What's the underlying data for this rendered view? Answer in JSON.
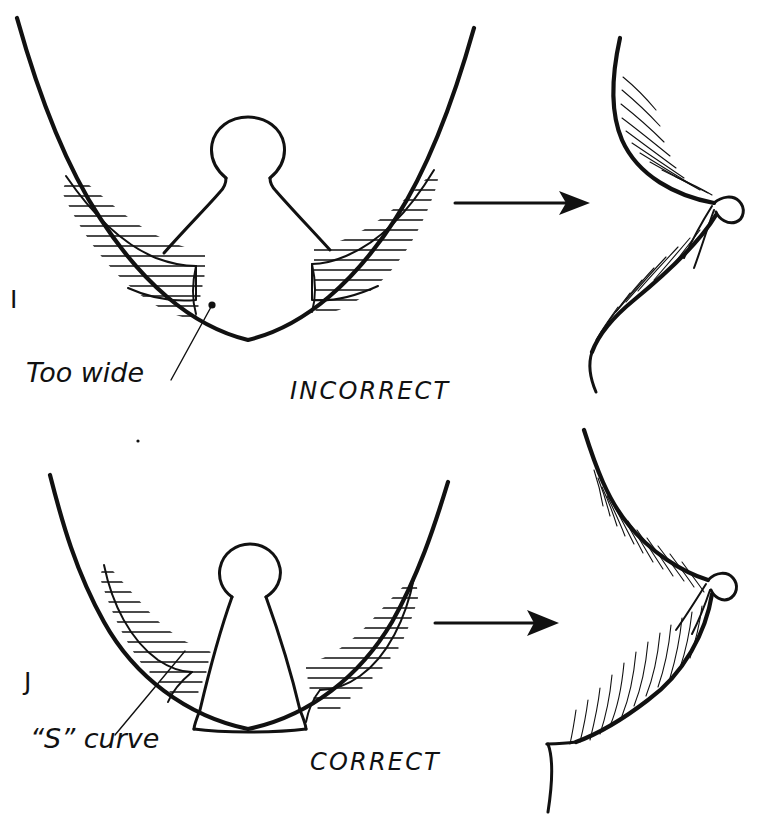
{
  "figure": {
    "background_color": "#ffffff",
    "ink_color": "#111111",
    "width": 770,
    "height": 823
  },
  "panels": [
    {
      "letter": "I",
      "verdict": "INCORRECT",
      "annotation": "Too wide",
      "frontal_view_note": "Wide rounded mound with broad hatched resection crescents",
      "profile_note": "Pointed projecting profile"
    },
    {
      "letter": "J",
      "verdict": "CORRECT",
      "annotation": "“S” curve",
      "frontal_view_note": "Narrow conical pedicle with S-shaped hatched resection crescents",
      "profile_note": "Rounded natural profile"
    }
  ],
  "labels": {
    "panel_i_letter": "I",
    "panel_j_letter": "J",
    "too_wide": "Too wide",
    "s_curve": "“S” curve",
    "incorrect": "INCORRECT",
    "correct": "CORRECT"
  },
  "arrows": [
    {
      "name": "arrow-incorrect",
      "from_x": 455,
      "to_x": 588,
      "y": 203
    },
    {
      "name": "arrow-correct",
      "from_x": 435,
      "to_x": 557,
      "y": 623
    }
  ],
  "colors": {
    "ink": "#111111",
    "paper": "#ffffff"
  }
}
